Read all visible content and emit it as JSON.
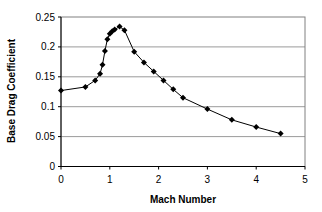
{
  "chart_data": {
    "type": "line",
    "title": "",
    "xlabel": "Mach Number",
    "ylabel": "Base Drag Coefficient",
    "xlim": [
      0,
      5
    ],
    "ylim": [
      0,
      0.25
    ],
    "x_ticks": [
      "0",
      "1",
      "2",
      "3",
      "4",
      "5"
    ],
    "y_ticks": [
      "0",
      "0.05",
      "0.1",
      "0.15",
      "0.2",
      "0.25"
    ],
    "grid": "horizontal",
    "legend": null,
    "marker": "diamond",
    "series": [
      {
        "name": "Base Drag Coefficient",
        "x": [
          0,
          0.5,
          0.7,
          0.8,
          0.85,
          0.9,
          0.95,
          1.0,
          1.05,
          1.1,
          1.2,
          1.3,
          1.5,
          1.7,
          1.9,
          2.1,
          2.3,
          2.5,
          3.0,
          3.5,
          4.0,
          4.5
        ],
        "y": [
          0.127,
          0.133,
          0.144,
          0.155,
          0.17,
          0.193,
          0.213,
          0.222,
          0.226,
          0.229,
          0.234,
          0.228,
          0.192,
          0.174,
          0.159,
          0.144,
          0.129,
          0.115,
          0.096,
          0.078,
          0.066,
          0.055
        ]
      }
    ]
  },
  "colors": {
    "line": "#000000",
    "grid": "#808080",
    "axis": "#000000",
    "background": "#ffffff"
  }
}
